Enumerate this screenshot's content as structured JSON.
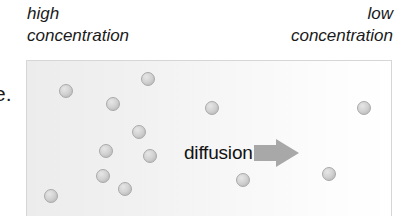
{
  "figure": {
    "type": "diffusion-diagram",
    "caption_left": "high\nconcentration",
    "caption_right": "low\nconcentration",
    "margin_fragments": {
      "upper": "e.",
      "lower": "n"
    },
    "colors": {
      "panel_background_left": "#ececed",
      "panel_background_right": "#ffffff",
      "panel_border": "#d6d6d6",
      "particle_fill": "#d2d2d2",
      "particle_border": "#a9a9a9",
      "arrow_fill": "#a8a8a8",
      "text": "#1a1a1a"
    },
    "arrows": [
      {
        "label": "diffusion",
        "direction": "right"
      },
      {
        "label": "diffusion",
        "direction": "right"
      }
    ],
    "particles": [
      {
        "x": 32,
        "y": 23
      },
      {
        "x": 114,
        "y": 11
      },
      {
        "x": 79,
        "y": 36
      },
      {
        "x": 178,
        "y": 40
      },
      {
        "x": 105,
        "y": 64
      },
      {
        "x": 72,
        "y": 83
      },
      {
        "x": 116,
        "y": 88
      },
      {
        "x": 209,
        "y": 112
      },
      {
        "x": 69,
        "y": 108
      },
      {
        "x": 91,
        "y": 121
      },
      {
        "x": 17,
        "y": 128
      },
      {
        "x": 330,
        "y": 40
      },
      {
        "x": 295,
        "y": 106
      }
    ],
    "particle_count": 13
  }
}
